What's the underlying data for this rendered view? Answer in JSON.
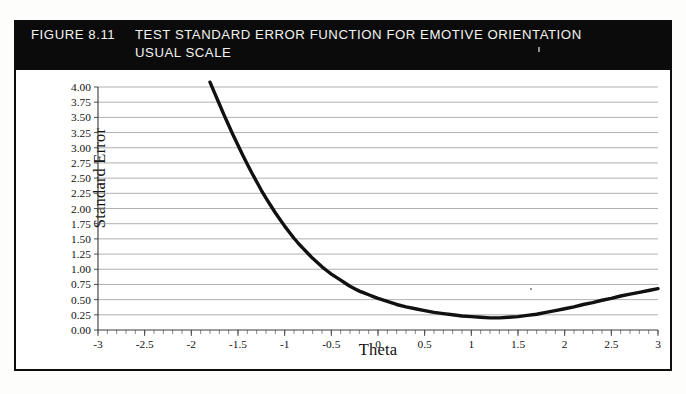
{
  "figure": {
    "number_label": "FIGURE 8.11",
    "title_line_1": "TEST STANDARD ERROR FUNCTION FOR EMOTIVE ORIENTATION",
    "title_line_2": "USUAL SCALE",
    "header_background": "#0b0b0b",
    "header_text_color": "#f3f3f0",
    "frame_color": "#0d0d0d"
  },
  "chart_data": {
    "type": "line",
    "xlabel": "Theta",
    "ylabel": "Standard Error",
    "xlim": [
      -3,
      3
    ],
    "ylim": [
      0,
      4
    ],
    "grid": true,
    "legend": false,
    "line_color": "#111111",
    "grid_color": "#8e8e8e",
    "x_ticks": [
      -3,
      -2.5,
      -2,
      -1.5,
      -1,
      -0.5,
      0,
      0.5,
      1,
      1.5,
      2,
      2.5,
      3
    ],
    "x_tick_labels": [
      "-3",
      "-2.5",
      "-2",
      "-1.5",
      "-1",
      "-0.5",
      "0",
      "0.5",
      "1",
      "1.5",
      "2",
      "2.5",
      "3"
    ],
    "x_minor_tick_step": 0.1,
    "y_ticks": [
      0,
      0.25,
      0.5,
      0.75,
      1,
      1.25,
      1.5,
      1.75,
      2,
      2.25,
      2.5,
      2.75,
      3,
      3.25,
      3.5,
      3.75,
      4
    ],
    "y_tick_labels": [
      "0.00",
      "0.25",
      "0.50",
      "0.75",
      "1.00",
      "1.25",
      "1.50",
      "1.75",
      "2.00",
      "2.25",
      "2.50",
      "2.75",
      "3.00",
      "3.25",
      "3.50",
      "3.75",
      "4.00"
    ],
    "series": [
      {
        "name": "Standard Error",
        "x": [
          -1.8,
          -1.75,
          -1.7,
          -1.65,
          -1.6,
          -1.55,
          -1.5,
          -1.45,
          -1.4,
          -1.35,
          -1.3,
          -1.25,
          -1.2,
          -1.15,
          -1.1,
          -1.05,
          -1.0,
          -0.95,
          -0.9,
          -0.85,
          -0.8,
          -0.75,
          -0.7,
          -0.65,
          -0.6,
          -0.55,
          -0.5,
          -0.45,
          -0.4,
          -0.35,
          -0.3,
          -0.25,
          -0.2,
          -0.15,
          -0.1,
          -0.05,
          0.0,
          0.1,
          0.2,
          0.3,
          0.4,
          0.5,
          0.6,
          0.7,
          0.8,
          0.9,
          1.0,
          1.1,
          1.2,
          1.25,
          1.3,
          1.4,
          1.5,
          1.6,
          1.7,
          1.8,
          1.9,
          2.0,
          2.1,
          2.2,
          2.3,
          2.4,
          2.5,
          2.6,
          2.7,
          2.8,
          2.9,
          3.0
        ],
        "y": [
          4.08,
          3.9,
          3.72,
          3.54,
          3.37,
          3.2,
          3.04,
          2.88,
          2.73,
          2.58,
          2.44,
          2.3,
          2.17,
          2.05,
          1.93,
          1.82,
          1.71,
          1.61,
          1.51,
          1.42,
          1.34,
          1.26,
          1.18,
          1.11,
          1.04,
          0.98,
          0.92,
          0.87,
          0.82,
          0.77,
          0.72,
          0.68,
          0.64,
          0.61,
          0.58,
          0.55,
          0.52,
          0.47,
          0.42,
          0.38,
          0.35,
          0.32,
          0.29,
          0.27,
          0.25,
          0.23,
          0.22,
          0.21,
          0.2,
          0.2,
          0.2,
          0.21,
          0.22,
          0.24,
          0.26,
          0.29,
          0.32,
          0.35,
          0.38,
          0.42,
          0.45,
          0.49,
          0.52,
          0.56,
          0.59,
          0.62,
          0.65,
          0.68
        ]
      }
    ],
    "annotations": {
      "minimum_theta": 1.25,
      "minimum_standard_error": 0.2,
      "curve_start_theta": -1.8,
      "curve_end_theta": 3.0
    }
  }
}
